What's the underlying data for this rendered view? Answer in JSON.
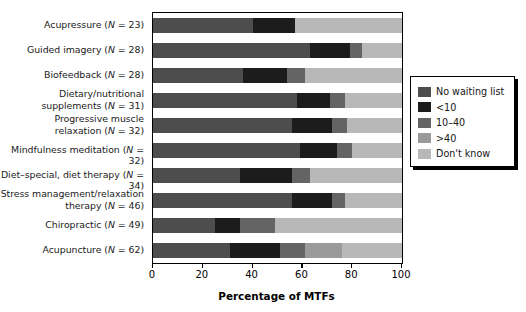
{
  "chart_data": {
    "type": "bar",
    "orientation": "horizontal",
    "stacked": true,
    "title": "",
    "xlabel": "Percentage of MTFs",
    "ylabel": "",
    "xlim": [
      0,
      100
    ],
    "xticks": [
      0,
      20,
      40,
      60,
      80,
      100
    ],
    "xticklabels": [
      "0",
      "20",
      "40",
      "60",
      "80",
      "100"
    ],
    "grid": false,
    "legend_position": "right",
    "categories": [
      "Acupressure (N = 23)",
      "Guided imagery (N = 28)",
      "Biofeedback (N = 28)",
      "Dietary/nutritional\nsupplements (N = 31)",
      "Progressive muscle\nrelaxation (N = 32)",
      "Mindfulness meditation (N = 32)",
      "Diet–special, diet therapy (N = 34)",
      "Stress management/relaxation\ntherapy (N = 46)",
      "Chiropractic (N = 49)",
      "Acupuncture (N = 62)"
    ],
    "series": [
      {
        "name": "No waiting list",
        "color": "#4d4d4d",
        "values": [
          40,
          63,
          36,
          58,
          56,
          59,
          35,
          56,
          25,
          31
        ]
      },
      {
        "name": "<10",
        "color": "#1c1c1c",
        "values": [
          17,
          16,
          18,
          13,
          16,
          15,
          21,
          16,
          10,
          20
        ]
      },
      {
        "name": "10–40",
        "color": "#646464",
        "values": [
          0,
          5,
          7,
          6,
          6,
          6,
          7,
          5,
          14,
          10
        ]
      },
      {
        "name": ">40",
        "color": "#9a9a9a",
        "values": [
          0,
          0,
          0,
          0,
          0,
          0,
          0,
          0,
          0,
          15
        ]
      },
      {
        "name": "Don't know",
        "color": "#b8b8b8",
        "values": [
          43,
          16,
          39,
          23,
          22,
          20,
          37,
          23,
          51,
          24
        ]
      }
    ]
  },
  "legend": {
    "items": [
      {
        "label": "No waiting list",
        "color": "#4d4d4d"
      },
      {
        "label": "<10",
        "color": "#1c1c1c"
      },
      {
        "label": "10–40",
        "color": "#646464"
      },
      {
        "label": ">40",
        "color": "#9a9a9a"
      },
      {
        "label": "Don't know",
        "color": "#b8b8b8"
      }
    ]
  },
  "axis": {
    "x_title": "Percentage of MTFs"
  }
}
